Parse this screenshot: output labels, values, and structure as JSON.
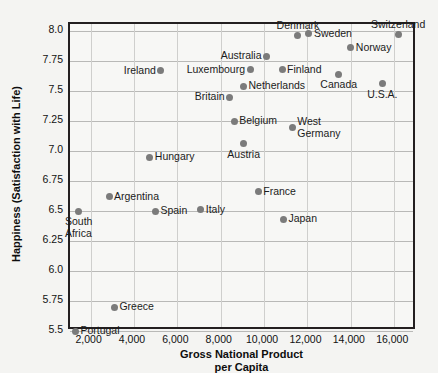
{
  "chart_data": {
    "type": "scatter",
    "title": "",
    "xlabel": "Gross National Product per Capita",
    "xlabel_line1": "Gross National Product",
    "xlabel_line2": "per Capita",
    "ylabel": "Happiness (Satisfaction with Life)",
    "xlim": [
      1050,
      17050
    ],
    "ylim": [
      5.5,
      8.06
    ],
    "xticks": [
      2000,
      4000,
      6000,
      8000,
      10000,
      12000,
      14000,
      16000
    ],
    "xtick_labels": [
      "2,000",
      "4,000",
      "6,000",
      "8,000",
      "10,000",
      "12,000",
      "14,000",
      "16,000"
    ],
    "yticks": [
      5.5,
      5.75,
      6.0,
      6.25,
      6.5,
      6.75,
      7.0,
      7.25,
      7.5,
      7.75,
      8.0
    ],
    "ytick_labels": [
      "5.5",
      "5.75",
      "6.0",
      "6.25",
      "6.5",
      "6.75",
      "7.0",
      "7.25",
      "7.5",
      "7.75",
      "8.0"
    ],
    "grid": true,
    "legend": "none",
    "marker_color": "#7b7b7b",
    "points": [
      {
        "label": "Portugal",
        "x": 1300,
        "y": 5.5,
        "label_pos": "right"
      },
      {
        "label": "Greece",
        "x": 3100,
        "y": 5.7,
        "label_pos": "right"
      },
      {
        "label": "South\nAfrica",
        "x": 1450,
        "y": 6.5,
        "label_pos": "below"
      },
      {
        "label": "Argentina",
        "x": 2850,
        "y": 6.62,
        "label_pos": "right"
      },
      {
        "label": "Spain",
        "x": 4990,
        "y": 6.5,
        "label_pos": "right"
      },
      {
        "label": "Italy",
        "x": 7080,
        "y": 6.51,
        "label_pos": "right"
      },
      {
        "label": "Hungary",
        "x": 4730,
        "y": 6.95,
        "label_pos": "right"
      },
      {
        "label": "France",
        "x": 9730,
        "y": 6.66,
        "label_pos": "right"
      },
      {
        "label": "Japan",
        "x": 10890,
        "y": 6.43,
        "label_pos": "right"
      },
      {
        "label": "Ireland",
        "x": 5240,
        "y": 7.67,
        "label_pos": "left"
      },
      {
        "label": "Austria",
        "x": 9060,
        "y": 7.06,
        "label_pos": "below"
      },
      {
        "label": "Belgium",
        "x": 8620,
        "y": 7.25,
        "label_pos": "right"
      },
      {
        "label": "Britain",
        "x": 8410,
        "y": 7.45,
        "label_pos": "left"
      },
      {
        "label": "Netherlands",
        "x": 9050,
        "y": 7.54,
        "label_pos": "right"
      },
      {
        "label": "Luxembourg",
        "x": 9350,
        "y": 7.68,
        "label_pos": "left"
      },
      {
        "label": "Australia",
        "x": 10110,
        "y": 7.79,
        "label_pos": "left"
      },
      {
        "label": "Finland",
        "x": 10830,
        "y": 7.68,
        "label_pos": "right"
      },
      {
        "label": "West\nGermany",
        "x": 11300,
        "y": 7.2,
        "label_pos": "right"
      },
      {
        "label": "Denmark",
        "x": 11560,
        "y": 7.96,
        "label_pos": "above"
      },
      {
        "label": "Sweden",
        "x": 12070,
        "y": 7.98,
        "label_pos": "right"
      },
      {
        "label": "Canada",
        "x": 13440,
        "y": 7.64,
        "label_pos": "below"
      },
      {
        "label": "Norway",
        "x": 14000,
        "y": 7.86,
        "label_pos": "right"
      },
      {
        "label": "U.S.A.",
        "x": 15450,
        "y": 7.56,
        "label_pos": "below"
      },
      {
        "label": "Switzerland",
        "x": 16180,
        "y": 7.97,
        "label_pos": "above"
      }
    ]
  }
}
